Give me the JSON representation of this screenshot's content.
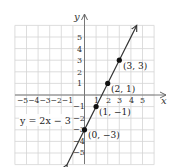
{
  "chart_data": {
    "type": "line",
    "title": "",
    "xlabel": "x",
    "ylabel": "y",
    "xlim": [
      -6,
      6
    ],
    "ylim": [
      -6,
      6
    ],
    "grid": true,
    "x_ticks": [
      "-5",
      "-4",
      "-3",
      "-2",
      "-1",
      "1",
      "2",
      "3",
      "4",
      "5"
    ],
    "x_tick_values": [
      -5,
      -4,
      -3,
      -2,
      -1,
      1,
      2,
      3,
      4,
      5
    ],
    "y_ticks": [
      "5",
      "4",
      "3",
      "2",
      "1",
      "-1",
      "-2",
      "-3",
      "-4",
      "-5"
    ],
    "y_tick_values": [
      5,
      4,
      3,
      2,
      1,
      -1,
      -2,
      -3,
      -4,
      -5
    ],
    "series": [
      {
        "name": "y = 2x − 3",
        "equation": "y = 2x − 3",
        "slope": 2,
        "intercept": -3,
        "x": [
          -1.5,
          4.5
        ],
        "y": [
          -6,
          6
        ]
      }
    ],
    "points": [
      {
        "x": 3,
        "y": 3,
        "label": "(3, 3)"
      },
      {
        "x": 2,
        "y": 1,
        "label": "(2, 1)"
      },
      {
        "x": 1,
        "y": -1,
        "label": "(1, −1)"
      },
      {
        "x": 0,
        "y": -3,
        "label": "(0, −3)"
      }
    ],
    "annotations": [
      {
        "text": "y = 2x − 3",
        "x": -4.3,
        "y": -2.5
      }
    ],
    "colors": {
      "grid": "#d0d0d0",
      "axes": "#666666",
      "line": "#333333",
      "points": "#111111",
      "text": "#333333"
    }
  },
  "labels": {
    "x_axis": "x",
    "y_axis": "y",
    "equation": "y = 2x − 3",
    "x_neg_ticks": "−5−4−3−2−1",
    "x_tick_1": "1",
    "x_tick_2": "2",
    "x_tick_3": "3",
    "x_tick_4": "4",
    "x_tick_5": "5",
    "y_tick_5": "5",
    "y_tick_4": "4",
    "y_tick_3": "3",
    "y_tick_2": "2",
    "y_tick_1": "1",
    "y_tick_m1": "−1",
    "y_tick_m2": "−2",
    "y_tick_m3": "−3",
    "y_tick_m4": "−4",
    "y_tick_m5": "−5",
    "point_3_3": "(3, 3)",
    "point_2_1": "(2, 1)",
    "point_1_m1": "(1, −1)",
    "point_0_m3": "(0, −3)"
  }
}
